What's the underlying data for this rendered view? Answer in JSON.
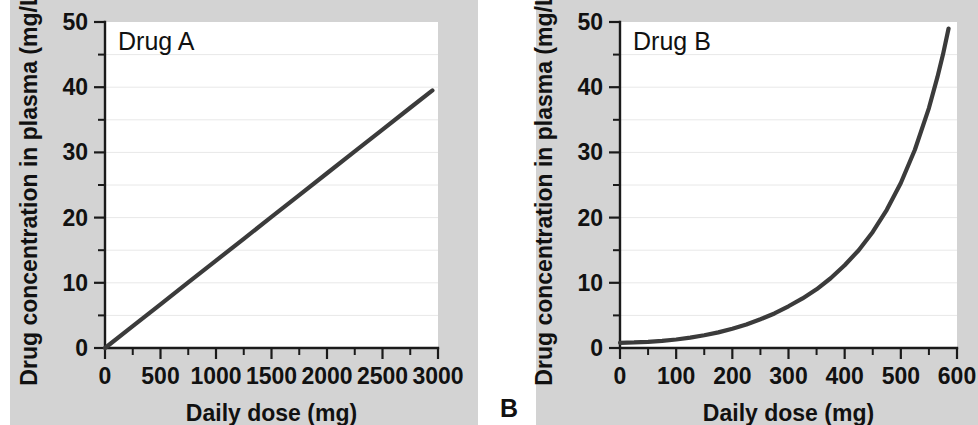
{
  "figure": {
    "width": 978,
    "height": 425,
    "background_color": "#ffffff",
    "panel_background_color": "#d3d3d3",
    "plot_background_color": "#ffffff",
    "line_color": "#3b3b3b",
    "axis_color": "#1a1a1a",
    "gridline_color": "#e8e8e8",
    "panel_letter_b": "B"
  },
  "chart_data": [
    {
      "type": "line",
      "title": "",
      "series_label": "Drug A",
      "xlabel": "Daily dose (mg)",
      "ylabel": "Drug concentration in plasma (mg/L)",
      "xlim": [
        0,
        3000
      ],
      "ylim": [
        0,
        50
      ],
      "xticks": [
        0,
        500,
        1000,
        1500,
        2000,
        2500,
        3000
      ],
      "xticklabels": [
        "0",
        "500",
        "1000",
        "1500",
        "2000",
        "2500",
        "3000"
      ],
      "x_minor_tick_interval": 250,
      "yticks": [
        0,
        10,
        20,
        30,
        40,
        50
      ],
      "yticklabels": [
        "0",
        "10",
        "20",
        "30",
        "40",
        "50"
      ],
      "y_minor_tick_interval": 5,
      "grid": "horizontal-minor",
      "legend": "none",
      "x": [
        0,
        250,
        500,
        750,
        1000,
        1250,
        1500,
        1750,
        2000,
        2250,
        2500,
        2750,
        2950
      ],
      "y": [
        0,
        3.35,
        6.7,
        10.05,
        13.4,
        16.75,
        20.1,
        23.45,
        26.8,
        30.15,
        33.5,
        36.85,
        39.5
      ]
    },
    {
      "type": "line",
      "title": "",
      "series_label": "Drug B",
      "xlabel": "Daily dose (mg)",
      "ylabel": "Drug concentration in plasma (mg/L)",
      "xlim": [
        0,
        600
      ],
      "ylim": [
        0,
        50
      ],
      "xticks": [
        0,
        100,
        200,
        300,
        400,
        500,
        600
      ],
      "xticklabels": [
        "0",
        "100",
        "200",
        "300",
        "400",
        "500",
        "600"
      ],
      "x_minor_tick_interval": 50,
      "yticks": [
        0,
        10,
        20,
        30,
        40,
        50
      ],
      "yticklabels": [
        "0",
        "10",
        "20",
        "30",
        "40",
        "50"
      ],
      "y_minor_tick_interval": 5,
      "grid": "horizontal-minor",
      "legend": "none",
      "x": [
        0,
        25,
        50,
        75,
        100,
        125,
        150,
        175,
        200,
        225,
        250,
        275,
        300,
        325,
        350,
        375,
        400,
        425,
        450,
        475,
        500,
        525,
        550,
        565,
        575,
        585
      ],
      "y": [
        0.8,
        0.85,
        0.95,
        1.1,
        1.3,
        1.6,
        1.95,
        2.4,
        2.95,
        3.6,
        4.4,
        5.3,
        6.4,
        7.6,
        9.0,
        10.7,
        12.7,
        15.0,
        17.8,
        21.2,
        25.3,
        30.4,
        36.8,
        41.5,
        45.0,
        49.0
      ]
    }
  ]
}
